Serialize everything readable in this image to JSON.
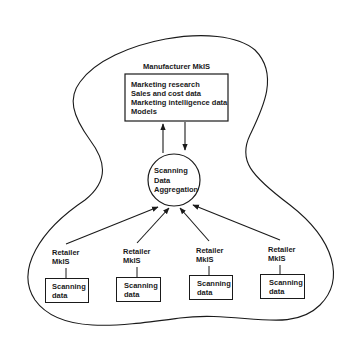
{
  "diagram": {
    "outer_region": {
      "label": "Manufacturer MkIS"
    },
    "manufacturer_box": {
      "lines": [
        "Marketing research",
        "Sales and cost data",
        "Marketing intelligence data",
        "Models"
      ]
    },
    "aggregation_node": {
      "lines": [
        "Scanning",
        "Data",
        "Aggregation"
      ]
    },
    "retailers": [
      {
        "label_line1": "Retailer",
        "label_line2": "MkIS",
        "box_line1": "Scanning",
        "box_line2": "data"
      },
      {
        "label_line1": "Retailer",
        "label_line2": "MkIS",
        "box_line1": "Scanning",
        "box_line2": "data"
      },
      {
        "label_line1": "Retailer",
        "label_line2": "MkIS",
        "box_line1": "Scanning",
        "box_line2": "data"
      },
      {
        "label_line1": "Retailer",
        "label_line2": "MkIS",
        "box_line1": "Scanning",
        "box_line2": "data"
      }
    ],
    "edges": [
      {
        "from": "aggregation_node",
        "to": "manufacturer_box",
        "direction": "up"
      },
      {
        "from": "manufacturer_box",
        "to": "aggregation_node",
        "direction": "down"
      },
      {
        "from": "retailer_1",
        "to": "aggregation_node"
      },
      {
        "from": "retailer_2",
        "to": "aggregation_node"
      },
      {
        "from": "retailer_3",
        "to": "aggregation_node"
      },
      {
        "from": "retailer_4",
        "to": "aggregation_node"
      }
    ],
    "colors": {
      "ink": "#1a1a1a",
      "background": "#ffffff"
    }
  }
}
